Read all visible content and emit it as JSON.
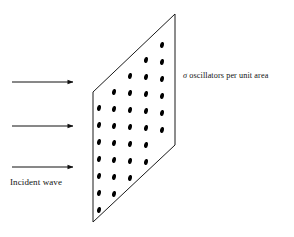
{
  "figure": {
    "background_color": "#ffffff",
    "ink_color": "#111111",
    "width": 294,
    "height": 237
  },
  "labels": {
    "sigma_symbol": "σ",
    "sigma_caption": " oscillators per unit area",
    "incident_wave": "Incident wave"
  },
  "sheet": {
    "name": "oscillator-sheet",
    "stroke_color": "#1a1a1a",
    "fill_color": "#ffffff",
    "corners": [
      {
        "x": 93,
        "y": 92
      },
      {
        "x": 175,
        "y": 14
      },
      {
        "x": 175,
        "y": 145
      },
      {
        "x": 93,
        "y": 222
      }
    ]
  },
  "oscillators": {
    "name": "oscillator-dots",
    "color": "#000000",
    "dot_rx": 1.9,
    "dot_ry": 3.0,
    "dot_rotation_deg": 12,
    "count": 34,
    "points": [
      {
        "x": 162,
        "y": 45
      },
      {
        "x": 146,
        "y": 60
      },
      {
        "x": 162,
        "y": 62
      },
      {
        "x": 130,
        "y": 76
      },
      {
        "x": 146,
        "y": 77
      },
      {
        "x": 162,
        "y": 79
      },
      {
        "x": 114,
        "y": 92
      },
      {
        "x": 130,
        "y": 93
      },
      {
        "x": 146,
        "y": 94
      },
      {
        "x": 162,
        "y": 96
      },
      {
        "x": 99,
        "y": 108
      },
      {
        "x": 114,
        "y": 109
      },
      {
        "x": 130,
        "y": 110
      },
      {
        "x": 146,
        "y": 111
      },
      {
        "x": 162,
        "y": 113
      },
      {
        "x": 99,
        "y": 125
      },
      {
        "x": 114,
        "y": 126
      },
      {
        "x": 130,
        "y": 127
      },
      {
        "x": 146,
        "y": 128
      },
      {
        "x": 162,
        "y": 130
      },
      {
        "x": 99,
        "y": 142
      },
      {
        "x": 114,
        "y": 143
      },
      {
        "x": 130,
        "y": 144
      },
      {
        "x": 146,
        "y": 145
      },
      {
        "x": 99,
        "y": 159
      },
      {
        "x": 114,
        "y": 160
      },
      {
        "x": 130,
        "y": 161
      },
      {
        "x": 146,
        "y": 162
      },
      {
        "x": 99,
        "y": 176
      },
      {
        "x": 114,
        "y": 177
      },
      {
        "x": 130,
        "y": 178
      },
      {
        "x": 99,
        "y": 193
      },
      {
        "x": 114,
        "y": 194
      },
      {
        "x": 99,
        "y": 210
      }
    ]
  },
  "arrows": {
    "name": "incident-wave-arrows",
    "color": "#111111",
    "stroke_width": 1,
    "items": [
      {
        "x1": 12,
        "y1": 82,
        "x2": 73,
        "y2": 82
      },
      {
        "x1": 12,
        "y1": 126,
        "x2": 73,
        "y2": 126
      },
      {
        "x1": 12,
        "y1": 167,
        "x2": 73,
        "y2": 167
      }
    ]
  }
}
